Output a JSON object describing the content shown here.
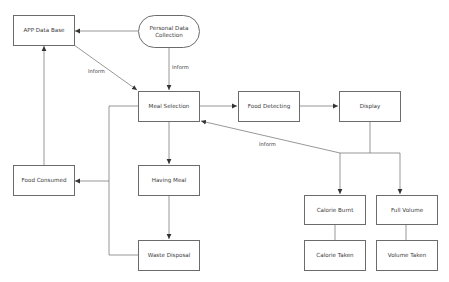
{
  "diagram": {
    "type": "flowchart",
    "nodes": {
      "app_data_base": "APP Data Base",
      "personal_data_collection": "Personal Data Collection",
      "meal_selection": "Meal Selection",
      "food_detecting": "Food Detecting",
      "display": "Display",
      "food_consumed": "Food Consumed",
      "having_meal": "Having Meal",
      "waste_disposal": "Waste Disposal",
      "calorie_burnt": "Calorie Burnt",
      "full_volume": "Full Volume",
      "calorie_taken": "Calorie Taken",
      "volume_taken": "Volume Taken"
    },
    "edge_labels": {
      "app_to_meal": "Inform",
      "personal_to_meal": "Inform",
      "calorie_to_meal": "Inform"
    },
    "edges": [
      {
        "from": "Personal Data Collection",
        "to": "APP Data Base"
      },
      {
        "from": "Personal Data Collection",
        "to": "Meal Selection",
        "label": "Inform"
      },
      {
        "from": "APP Data Base",
        "to": "Meal Selection",
        "label": "Inform"
      },
      {
        "from": "Meal Selection",
        "to": "Food Detecting"
      },
      {
        "from": "Food Detecting",
        "to": "Display"
      },
      {
        "from": "Display",
        "to": "Calorie Burnt"
      },
      {
        "from": "Display",
        "to": "Full Volume"
      },
      {
        "from": "Calorie Burnt",
        "to": "Meal Selection",
        "label": "Inform"
      },
      {
        "from": "Calorie Burnt",
        "to": "Calorie Taken"
      },
      {
        "from": "Full Volume",
        "to": "Volume Taken"
      },
      {
        "from": "Meal Selection",
        "to": "Having Meal"
      },
      {
        "from": "Having Meal",
        "to": "Waste Disposal"
      },
      {
        "from": "Meal Selection",
        "to": "Food Consumed"
      },
      {
        "from": "Waste Disposal",
        "to": "Food Consumed"
      },
      {
        "from": "Food Consumed",
        "to": "APP Data Base"
      }
    ],
    "colors": {
      "stroke": "#6b6b6b",
      "text": "#3a3a3a",
      "background": "#ffffff"
    }
  }
}
